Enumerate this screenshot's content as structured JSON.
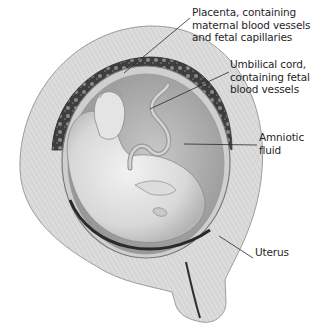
{
  "figure": {
    "type": "anatomical-illustration",
    "colors": {
      "background": "#ffffff",
      "uterine_wall": "#d9d9d9",
      "uterine_wall_stripe": "#bdbdbd",
      "placenta": "#4a4a4a",
      "amniotic_cavity": "#a9a9a9",
      "fetus": "#e6e6e6",
      "leader_line": "#2a2a2a",
      "text": "#1f1f1f"
    }
  },
  "labels": [
    {
      "id": "placenta",
      "text": "Placenta, containing\nmaternal blood vessels\nand fetal capillaries",
      "x": 192,
      "y": 12,
      "line": {
        "x1": 190,
        "y1": 18,
        "x2": 124,
        "y2": 73
      }
    },
    {
      "id": "umbilical-cord",
      "text": "Umbilical cord,\ncontaining fetal\nblood vessels",
      "x": 230,
      "y": 64,
      "line": {
        "x1": 229,
        "y1": 72,
        "x2": 150,
        "y2": 109
      }
    },
    {
      "id": "amniotic-fluid",
      "text": "Amniotic\nfluid",
      "x": 259,
      "y": 137,
      "line": {
        "x1": 257,
        "y1": 145,
        "x2": 184,
        "y2": 144
      }
    },
    {
      "id": "uterus",
      "text": "Uterus",
      "x": 255,
      "y": 252,
      "line": {
        "x1": 253,
        "y1": 258,
        "x2": 219,
        "y2 ": 236
      }
    }
  ]
}
